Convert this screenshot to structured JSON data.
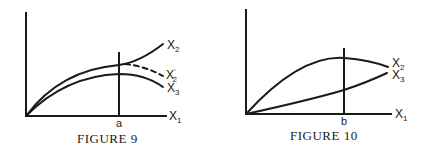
{
  "figures": [
    {
      "caption": "FIGURE 9",
      "x_axis_label": "X",
      "x_axis_sub": "1",
      "tick_label": "a",
      "curves": [
        {
          "name": "X",
          "sub": "2",
          "prime": "",
          "style": "solid"
        },
        {
          "name": "X",
          "sub": "2",
          "prime": "'",
          "style": "dashed"
        },
        {
          "name": "X",
          "sub": "3",
          "prime": "",
          "style": "solid"
        }
      ]
    },
    {
      "caption": "FIGURE 10",
      "x_axis_label": "X",
      "x_axis_sub": "1",
      "tick_label": "b",
      "curves": [
        {
          "name": "X",
          "sub": "2",
          "prime": "",
          "style": "solid"
        },
        {
          "name": "X",
          "sub": "3",
          "prime": "",
          "style": "solid"
        }
      ]
    }
  ],
  "colors": {
    "ink": "#1a1a1a",
    "background": "#ffffff"
  }
}
